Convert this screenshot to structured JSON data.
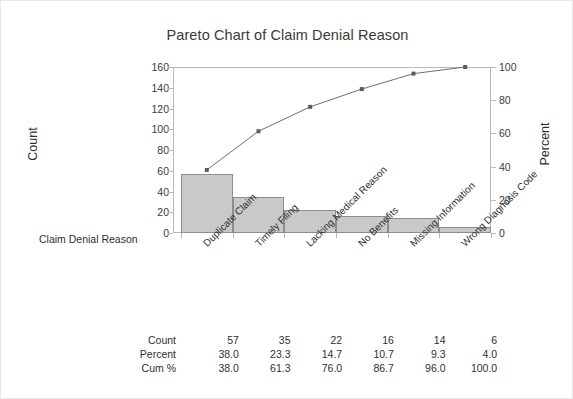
{
  "chart_data": {
    "type": "bar",
    "title": "Pareto Chart of Claim Denial Reason",
    "xlabel": "Claim Denial Reason",
    "ylabel": "Count",
    "y2label": "Percent",
    "categories": [
      "Duplicate Claim",
      "Timely Filing",
      "Lacking Medical Reason",
      "No Benefits",
      "Missing Information",
      "Wrong Diagnosis Code"
    ],
    "values": [
      57,
      35,
      22,
      16,
      14,
      6
    ],
    "series": [
      {
        "name": "Count",
        "values": [
          57,
          35,
          22,
          16,
          14,
          6
        ]
      },
      {
        "name": "Cum %",
        "values": [
          38.0,
          61.3,
          76.0,
          86.7,
          96.0,
          100.0
        ]
      }
    ],
    "percent": [
      38.0,
      23.3,
      14.7,
      10.7,
      9.3,
      4.0
    ],
    "ylim": [
      0,
      160
    ],
    "y2lim": [
      0,
      100
    ],
    "yticks": [
      0,
      20,
      40,
      60,
      80,
      100,
      120,
      140,
      160
    ],
    "y2ticks": [
      0,
      20,
      40,
      60,
      80,
      100
    ],
    "grid": false,
    "legend": "none",
    "bar_color": "#c9c9c9",
    "bar_border_color": "#8d8d8d",
    "line_color": "#6e6e78",
    "marker_color": "#5a5a64",
    "frame_color": "#b9b9b9"
  },
  "table": {
    "rows": [
      {
        "label": "Count",
        "cells": [
          "57",
          "35",
          "22",
          "16",
          "14",
          "6"
        ]
      },
      {
        "label": "Percent",
        "cells": [
          "38.0",
          "23.3",
          "14.7",
          "10.7",
          "9.3",
          "4.0"
        ]
      },
      {
        "label": "Cum %",
        "cells": [
          "38.0",
          "61.3",
          "76.0",
          "86.7",
          "96.0",
          "100.0"
        ]
      }
    ]
  }
}
